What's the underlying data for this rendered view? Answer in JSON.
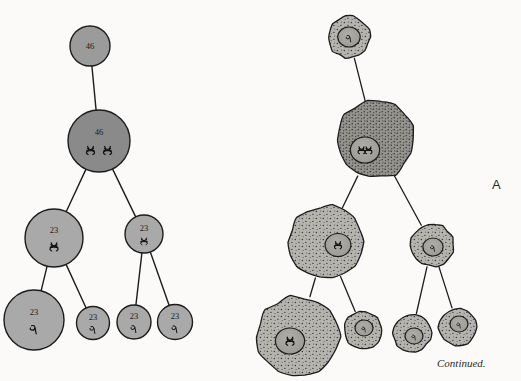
{
  "figure": {
    "panel_label": "A",
    "continued_note": "Continued.",
    "background_color": "#fbfaf8",
    "ink_color": "#1c1c1c"
  },
  "colors": {
    "schematic_dark": "#8a8a8a",
    "schematic_mid": "#9b9b9b",
    "schematic_light": "#a9a9a9",
    "cell_stipple_light": "#b3b1ac",
    "cell_stipple_dark": "#8d8b86",
    "outline": "#1c1c1c",
    "nucleus_fill": "#a3a19c"
  },
  "schematic_tree": {
    "name": "chromosome-number-schematic",
    "nodes": [
      {
        "id": "s0",
        "label": "46",
        "glyph": "none",
        "cx": 90,
        "cy": 46,
        "r": 20,
        "shade": "schematic_mid"
      },
      {
        "id": "s1",
        "label": "46",
        "glyph": "double-pair",
        "cx": 99,
        "cy": 141,
        "r": 31,
        "shade": "schematic_dark"
      },
      {
        "id": "s2",
        "label": "23",
        "glyph": "single-pair",
        "cx": 54,
        "cy": 238,
        "r": 29,
        "shade": "schematic_light"
      },
      {
        "id": "s3",
        "label": "23",
        "glyph": "single-pair",
        "cx": 144,
        "cy": 234,
        "r": 19,
        "shade": "schematic_light"
      },
      {
        "id": "s4",
        "label": "23",
        "glyph": "single",
        "cx": 34,
        "cy": 320,
        "r": 30,
        "shade": "schematic_light"
      },
      {
        "id": "s5",
        "label": "23",
        "glyph": "single",
        "cx": 93,
        "cy": 323,
        "r": 16.5,
        "shade": "schematic_light"
      },
      {
        "id": "s6",
        "label": "23",
        "glyph": "single",
        "cx": 134,
        "cy": 322,
        "r": 17,
        "shade": "schematic_light"
      },
      {
        "id": "s7",
        "label": "23",
        "glyph": "single",
        "cx": 175,
        "cy": 322,
        "r": 17.5,
        "shade": "schematic_light"
      }
    ],
    "edges": [
      {
        "from": "s0",
        "to": "s1"
      },
      {
        "from": "s1",
        "to": "s2"
      },
      {
        "from": "s1",
        "to": "s3"
      },
      {
        "from": "s2",
        "to": "s4"
      },
      {
        "from": "s2",
        "to": "s5"
      },
      {
        "from": "s3",
        "to": "s6"
      },
      {
        "from": "s3",
        "to": "s7"
      }
    ]
  },
  "cell_tree": {
    "name": "stippled-cell-lineage",
    "nodes": [
      {
        "id": "c0",
        "cx": 349,
        "cy": 37,
        "r": 21,
        "nr": 10,
        "stipple": "cell_stipple_light"
      },
      {
        "id": "c1",
        "cx": 375,
        "cy": 140,
        "r": 39,
        "nr": 13,
        "nox": -10,
        "noy": 10,
        "stipple": "cell_stipple_dark"
      },
      {
        "id": "c2",
        "cx": 326,
        "cy": 242,
        "r": 36.5,
        "nr": 11.5,
        "nox": 12,
        "noy": 3,
        "stipple": "cell_stipple_light"
      },
      {
        "id": "c3",
        "cx": 432,
        "cy": 245,
        "r": 21.5,
        "nr": 9,
        "nox": 1,
        "noy": 2,
        "stipple": "cell_stipple_light"
      },
      {
        "id": "c4",
        "cx": 298,
        "cy": 337,
        "r": 41,
        "nr": 13,
        "nox": -8,
        "noy": 4,
        "stipple": "cell_stipple_light"
      },
      {
        "id": "c5",
        "cx": 363,
        "cy": 330,
        "r": 19,
        "nr": 8,
        "nox": 1,
        "noy": -2,
        "stipple": "cell_stipple_light"
      },
      {
        "id": "c6",
        "cx": 412,
        "cy": 333,
        "r": 19,
        "nr": 8,
        "nox": 2,
        "noy": 3,
        "stipple": "cell_stipple_light"
      },
      {
        "id": "c7",
        "cx": 458,
        "cy": 327,
        "r": 19,
        "nr": 8,
        "nox": 1,
        "noy": -3,
        "stipple": "cell_stipple_light"
      }
    ],
    "edges": [
      {
        "from": "c0",
        "to": "c1"
      },
      {
        "from": "c1",
        "to": "c2"
      },
      {
        "from": "c1",
        "to": "c3"
      },
      {
        "from": "c2",
        "to": "c4"
      },
      {
        "from": "c2",
        "to": "c5"
      },
      {
        "from": "c3",
        "to": "c6"
      },
      {
        "from": "c3",
        "to": "c7"
      }
    ]
  }
}
